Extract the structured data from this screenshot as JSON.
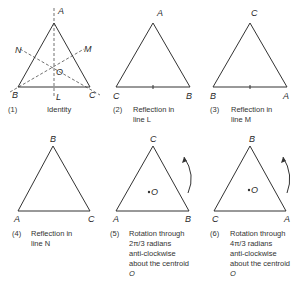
{
  "panels": [
    {
      "number": "(1)",
      "caption_lines": [
        "Identity"
      ],
      "vertices": {
        "top": "A",
        "left": "B",
        "right": "C"
      },
      "axes": [
        "L",
        "M",
        "N"
      ],
      "centre": "O"
    },
    {
      "number": "(2)",
      "caption_lines": [
        "Reflection in",
        "line L"
      ],
      "vertices": {
        "top": "A",
        "left": "C",
        "right": "B"
      }
    },
    {
      "number": "(3)",
      "caption_lines": [
        "Reflection in",
        "line M"
      ],
      "vertices": {
        "top": "C",
        "left": "B",
        "right": "A"
      }
    },
    {
      "number": "(4)",
      "caption_lines": [
        "Reflection in",
        "line N"
      ],
      "vertices": {
        "top": "B",
        "left": "A",
        "right": "C"
      }
    },
    {
      "number": "(5)",
      "caption_lines": [
        "Rotation through",
        "2π/3 radians",
        "anti-clockwise",
        "about the centroid",
        "O"
      ],
      "vertices": {
        "top": "C",
        "left": "A",
        "right": "B"
      },
      "centre": "O"
    },
    {
      "number": "(6)",
      "caption_lines": [
        "Rotation through",
        "4π/3 radians",
        "anti-clockwise",
        "about the centroid",
        "O"
      ],
      "vertices": {
        "top": "B",
        "left": "C",
        "right": "A"
      },
      "centre": "O"
    }
  ]
}
